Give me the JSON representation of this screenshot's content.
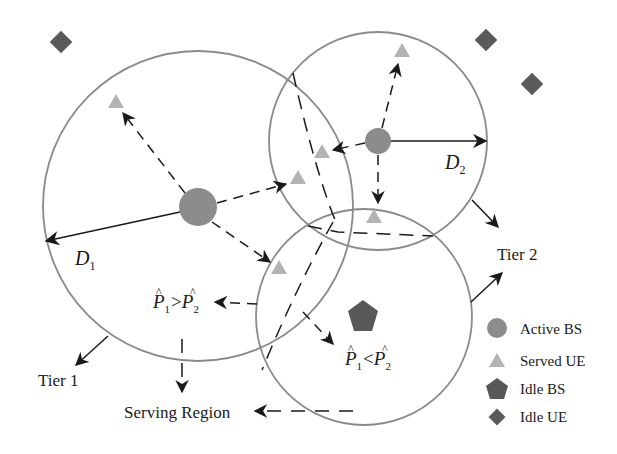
{
  "diagram": {
    "type": "two-tier cellular network coverage diagram",
    "colors": {
      "background": "#ffffff",
      "circle_stroke": "#8a8a8a",
      "active_bs": "#8c8c8c",
      "served_ue": "#b3b3b3",
      "idle_bs": "#585858",
      "idle_ue": "#5a5a5a",
      "arrow": "#1a1a1a"
    },
    "labels": {
      "d1": "D",
      "d1_sub": "1",
      "d2": "D",
      "d2_sub": "2",
      "tier1": "Tier 1",
      "tier2": "Tier 2",
      "serving_region": "Serving Region",
      "cond_gt": {
        "p1": "P",
        "sub1": "1",
        "op": ">",
        "p2": "P",
        "sub2": "2",
        "hat": "^"
      },
      "cond_lt": {
        "p1": "P",
        "sub1": "1",
        "op": "<",
        "p2": "P",
        "sub2": "2",
        "hat": "^"
      }
    },
    "legend": [
      {
        "shape": "circle",
        "label": "Active BS"
      },
      {
        "shape": "triangle",
        "label": "Served UE"
      },
      {
        "shape": "pentagon",
        "label": "Idle BS"
      },
      {
        "shape": "diamond",
        "label": "Idle UE"
      }
    ],
    "nodes": {
      "tier1_bs": {
        "x": 198,
        "y": 207,
        "r": 19
      },
      "tier2_bs": {
        "x": 378,
        "y": 141,
        "r": 13
      },
      "idle_bs": {
        "x": 363,
        "y": 317
      },
      "served_ues": [
        {
          "x": 116,
          "y": 102
        },
        {
          "x": 298,
          "y": 178
        },
        {
          "x": 322,
          "y": 152
        },
        {
          "x": 402,
          "y": 50
        },
        {
          "x": 374,
          "y": 217
        },
        {
          "x": 279,
          "y": 268
        }
      ],
      "idle_ues": [
        {
          "x": 61,
          "y": 42
        },
        {
          "x": 486,
          "y": 40
        },
        {
          "x": 532,
          "y": 84
        }
      ]
    },
    "coverage": [
      {
        "name": "tier1-cell",
        "cx": 198,
        "cy": 206,
        "r": 155
      },
      {
        "name": "tier2-cell-active",
        "cx": 378,
        "cy": 141,
        "r": 109
      },
      {
        "name": "tier2-cell-idle",
        "cx": 364,
        "cy": 317,
        "r": 108
      }
    ]
  }
}
